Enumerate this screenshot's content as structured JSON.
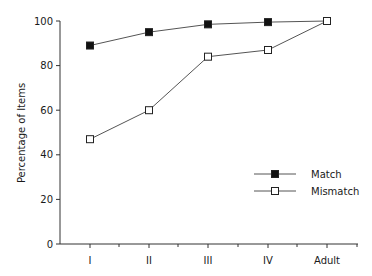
{
  "chart_data": {
    "type": "line",
    "title": "",
    "xlabel": "",
    "ylabel": "Percentage of Items",
    "categories": [
      "I",
      "II",
      "III",
      "IV",
      "Adult"
    ],
    "series": [
      {
        "name": "Match",
        "marker": "filled-square",
        "values": [
          89,
          95,
          98.5,
          99.5,
          100
        ]
      },
      {
        "name": "Mismatch",
        "marker": "open-square",
        "values": [
          47,
          60,
          84,
          87,
          100
        ]
      }
    ],
    "ylim": [
      0,
      100
    ],
    "yticks": [
      0,
      20,
      40,
      60,
      80,
      100
    ],
    "grid": false,
    "legend_position": "lower-right-inside"
  },
  "legend": {
    "items": [
      {
        "label": "Match"
      },
      {
        "label": "Mismatch"
      }
    ]
  },
  "colors": {
    "line": "#555555",
    "axis": "#333333",
    "marker_fill_match": "#111111",
    "marker_fill_mismatch": "#ffffff"
  }
}
